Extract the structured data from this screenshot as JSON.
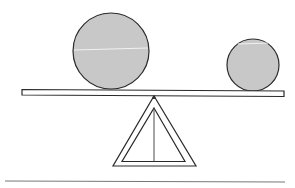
{
  "diagram": {
    "type": "balance-scale",
    "colors": {
      "background": "#ffffff",
      "stroke": "#2a2a2a",
      "ball_fill": "#c8c8c8",
      "ground": "#777777"
    },
    "objects": [
      {
        "name": "large-ball",
        "cx": 111,
        "cy": 51,
        "r": 38
      },
      {
        "name": "small-ball",
        "cx": 253,
        "cy": 64,
        "r": 26
      }
    ],
    "plank": {
      "x1": 22,
      "y_left": 89,
      "x2": 284,
      "y_right": 91,
      "thickness": 6
    },
    "fulcrum": {
      "apex_x": 154,
      "apex_y": 96,
      "base_y": 166,
      "base_left": 112,
      "base_right": 196
    },
    "ground_line": {
      "x1": 5,
      "x2": 285,
      "y": 181
    }
  }
}
